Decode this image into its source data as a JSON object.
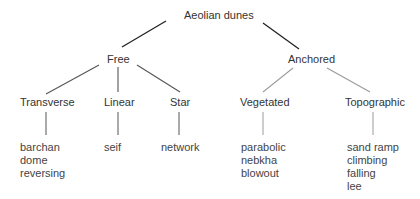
{
  "diagram": {
    "title": "Aeolian dunes",
    "colors": {
      "primary_edge": "#222222",
      "secondary_edge": "#9a9a9a",
      "text": "#333333"
    },
    "root": {
      "label": "Aeolian dunes",
      "children": [
        {
          "label": "Free",
          "children": [
            {
              "label": "Transverse",
              "examples": [
                "barchan",
                "dome",
                "reversing"
              ]
            },
            {
              "label": "Linear",
              "examples": [
                "seif"
              ]
            },
            {
              "label": "Star",
              "examples": [
                "network"
              ]
            }
          ]
        },
        {
          "label": "Anchored",
          "children": [
            {
              "label": "Vegetated",
              "examples": [
                "parabolic",
                "nebkha",
                "blowout"
              ]
            },
            {
              "label": "Topographic",
              "examples": [
                "sand ramp",
                "climbing",
                "falling",
                "lee"
              ]
            }
          ]
        }
      ]
    }
  }
}
